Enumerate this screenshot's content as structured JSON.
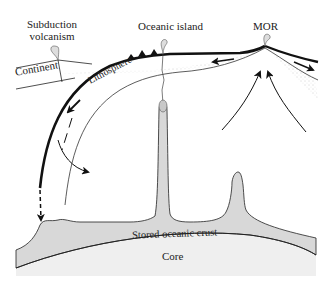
{
  "labels": {
    "subduction_line1": "Subduction",
    "subduction_line2": "volcanism",
    "oceanic_island": "Oceanic island",
    "mor": "MOR",
    "continent": "Continent",
    "lithosphere": "Lithosphere",
    "stored_crust": "Stored oceanic crust",
    "core": "Core"
  },
  "colors": {
    "mantle_fill": "#d8d8d8",
    "core_fill": "#efefef",
    "line": "#111111",
    "stipple": "#9a9a9a"
  }
}
